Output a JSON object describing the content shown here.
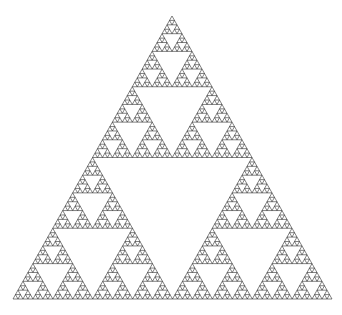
{
  "figure": {
    "kind": "fractal-line-drawing",
    "caption": "",
    "background_color": "#ffffff"
  },
  "chart_data": {
    "type": "scatter",
    "subtitle": "",
    "xlabel": "",
    "ylabel": "",
    "grid": false,
    "legend": null,
    "legend_position": "none",
    "annotations": [],
    "tick_labels": {
      "x": [],
      "y": []
    },
    "axis_visible": false,
    "fractal": {
      "name": "Sierpinski triangle",
      "construction": "recursive-subdivision",
      "recursion_depth": 6,
      "smallest_triangles_along_base": 64,
      "total_filled_triangles": 729,
      "removed_central_holes": 364,
      "hausdorff_dimension": 1.585,
      "orientation": "apex-up",
      "vertices": {
        "apex": [
          172,
          16
        ],
        "bottom_left": [
          13,
          299
        ],
        "bottom_right": [
          332,
          299
        ]
      },
      "bounding_box": {
        "x": 13,
        "y": 16,
        "width": 319,
        "height": 283
      },
      "stroke_color": "#1a1a1a",
      "stroke_width": 0.55,
      "fill_color": "none"
    },
    "ylim": [
      0,
      315
    ],
    "xlim": [
      0,
      342
    ]
  }
}
